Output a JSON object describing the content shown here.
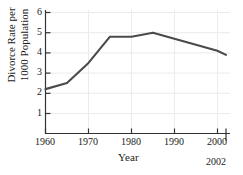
{
  "chart_data": {
    "type": "line",
    "title": "",
    "xlabel": "Year",
    "ylabel": "Divorce Rate per 1000 Population",
    "ylabel_line1": "Divorce Rate per",
    "ylabel_line2": "1000 Population",
    "x": [
      1960,
      1965,
      1970,
      1975,
      1980,
      1985,
      1990,
      1995,
      2000,
      2002
    ],
    "values": [
      2.2,
      2.5,
      3.5,
      4.8,
      4.8,
      5.0,
      4.7,
      4.4,
      4.1,
      3.9
    ],
    "series": [
      {
        "name": "Divorce Rate",
        "values": [
          2.2,
          2.5,
          3.5,
          4.8,
          4.8,
          5.0,
          4.7,
          4.4,
          4.1,
          3.9
        ]
      }
    ],
    "xlim": [
      1960,
      2002
    ],
    "ylim": [
      0,
      6
    ],
    "xticks": [
      1960,
      1970,
      1980,
      1990,
      2000
    ],
    "xtick_labels": [
      "1960",
      "1970",
      "1980",
      "1990",
      "2000"
    ],
    "yticks": [
      1,
      2,
      3,
      4,
      5,
      6
    ],
    "ytick_labels": [
      "1",
      "2",
      "3",
      "4",
      "5",
      "6"
    ],
    "extra_xtick": 2002,
    "extra_xtick_label": "2002",
    "grid": true,
    "legend": "none",
    "line_color": "#4a4a4a",
    "grid_color": "#ebebeb",
    "axis_color": "#333333",
    "background_color": "#ffffff"
  }
}
